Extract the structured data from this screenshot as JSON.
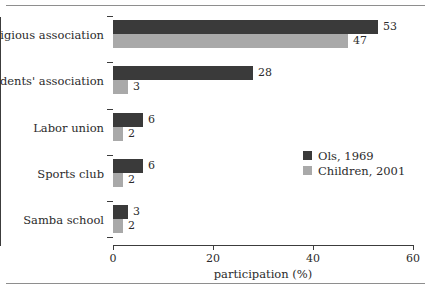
{
  "chart_data": {
    "type": "bar",
    "orientation": "horizontal",
    "title": "",
    "subtitle": "",
    "xlabel": "participation (%)",
    "ylabel": "",
    "xlim": [
      0,
      60
    ],
    "xticks": [
      0,
      20,
      40,
      60
    ],
    "xtick_labels": [
      "0",
      "20",
      "40",
      "60"
    ],
    "grid": false,
    "legend_position": "center-right",
    "categories": [
      "Religious association",
      "Residents' association",
      "Labor union",
      "Sports club",
      "Samba school"
    ],
    "series": [
      {
        "name": "Ols, 1969",
        "color": "#3a3a3a",
        "values": [
          53,
          28,
          6,
          6,
          3
        ],
        "value_labels": [
          "53",
          "28",
          "6",
          "6",
          "3"
        ]
      },
      {
        "name": "Children, 2001",
        "color": "#a9a9a9",
        "values": [
          47,
          3,
          2,
          2,
          2
        ],
        "value_labels": [
          "47",
          "3",
          "2",
          "2",
          "2"
        ]
      }
    ]
  },
  "legend": {
    "entries": [
      {
        "label": "Ols, 1969",
        "color": "#3a3a3a"
      },
      {
        "label": "Children, 2001",
        "color": "#a9a9a9"
      }
    ]
  },
  "axis": {
    "x_title": "participation (%)",
    "x_tick_labels": [
      "0",
      "20",
      "40",
      "60"
    ]
  }
}
